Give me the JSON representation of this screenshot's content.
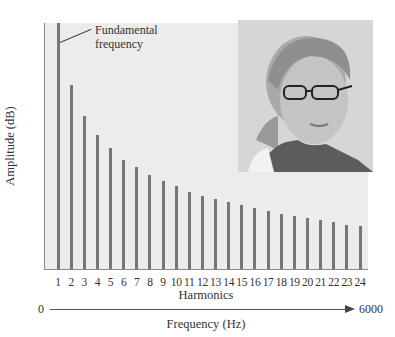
{
  "chart_data": {
    "type": "bar",
    "title": "",
    "xlabel": "Harmonics",
    "ylabel": "Amplitude (dB)",
    "categories": [
      "1",
      "2",
      "3",
      "4",
      "5",
      "6",
      "7",
      "8",
      "9",
      "10",
      "11",
      "12",
      "13",
      "14",
      "15",
      "16",
      "17",
      "18",
      "19",
      "20",
      "21",
      "22",
      "23",
      "24"
    ],
    "values": [
      246,
      184,
      153,
      134,
      121,
      109,
      102,
      94,
      88,
      83,
      77,
      73,
      70,
      67,
      64,
      61,
      58,
      55,
      53,
      51,
      49,
      47,
      44,
      43
    ],
    "value_units": "relative amplitude (pixel height, no numeric y ticks shown)",
    "ylim": [
      0,
      246
    ],
    "grid": false,
    "legend": null,
    "annotations": [
      {
        "text": "Fundamental frequency",
        "target": "1"
      }
    ],
    "secondary_axis": {
      "label": "Frequency (Hz)",
      "start": "0",
      "end": "6000"
    },
    "colors": {
      "bar": "#767676",
      "plot_background": "#ececec",
      "axis": "#8a8a8a"
    }
  },
  "annotation": {
    "line1": "Fundamental",
    "line2": "frequency"
  },
  "axes": {
    "ylabel": "Amplitude (dB)",
    "xlabel": "Harmonics",
    "freq_label": "Frequency (Hz)",
    "freq_start": "0",
    "freq_end": "6000"
  },
  "photo": {
    "description": "portrait-photo"
  }
}
